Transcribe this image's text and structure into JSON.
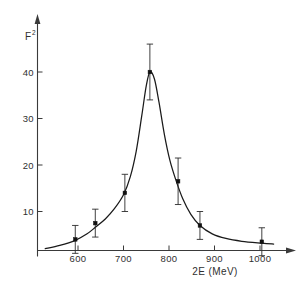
{
  "chart_data": {
    "type": "scatter",
    "title": "",
    "subtitle": "",
    "xlabel": "2E  (MeV)",
    "ylabel": "F",
    "ylabel_superscript": "2",
    "ylabel_full": "F2",
    "xlim": [
      520,
      1045
    ],
    "ylim": [
      0,
      48
    ],
    "xticks": [
      600,
      700,
      800,
      900,
      1000
    ],
    "xtick_labels": [
      "600",
      "700",
      "800",
      "900",
      "1000"
    ],
    "yticks": [
      10,
      20,
      30,
      40
    ],
    "ytick_labels": [
      "10",
      "20",
      "30",
      "40"
    ],
    "grid": false,
    "legend": null,
    "legend_position": "none",
    "x": [
      594,
      638,
      703,
      758,
      820,
      868,
      1004
    ],
    "values": [
      4.0,
      7.5,
      14.0,
      40.0,
      16.5,
      7.0,
      3.5
    ],
    "yerr": [
      3.0,
      3.0,
      4.0,
      6.0,
      5.0,
      3.0,
      3.0
    ],
    "series": [
      {
        "name": "measured F2",
        "marker": "square-dot",
        "points": [
          {
            "x": 594,
            "y": 4.0,
            "yerr": 3.0
          },
          {
            "x": 638,
            "y": 7.5,
            "yerr": 3.0
          },
          {
            "x": 703,
            "y": 14.0,
            "yerr": 4.0
          },
          {
            "x": 758,
            "y": 40.0,
            "yerr": 6.0
          },
          {
            "x": 820,
            "y": 16.5,
            "yerr": 5.0
          },
          {
            "x": 868,
            "y": 7.0,
            "yerr": 3.0
          },
          {
            "x": 1004,
            "y": 3.5,
            "yerr": 3.0
          }
        ]
      },
      {
        "name": "fitted resonance curve",
        "marker": "none",
        "curve": [
          {
            "x": 528,
            "y": 2.0
          },
          {
            "x": 560,
            "y": 2.7
          },
          {
            "x": 594,
            "y": 3.8
          },
          {
            "x": 620,
            "y": 5.2
          },
          {
            "x": 638,
            "y": 6.6
          },
          {
            "x": 660,
            "y": 8.4
          },
          {
            "x": 680,
            "y": 10.6
          },
          {
            "x": 700,
            "y": 13.6
          },
          {
            "x": 715,
            "y": 17.5
          },
          {
            "x": 728,
            "y": 23.0
          },
          {
            "x": 740,
            "y": 30.5
          },
          {
            "x": 750,
            "y": 37.0
          },
          {
            "x": 758,
            "y": 40.0
          },
          {
            "x": 768,
            "y": 38.5
          },
          {
            "x": 778,
            "y": 33.5
          },
          {
            "x": 790,
            "y": 26.5
          },
          {
            "x": 802,
            "y": 21.0
          },
          {
            "x": 815,
            "y": 16.8
          },
          {
            "x": 830,
            "y": 12.8
          },
          {
            "x": 848,
            "y": 9.4
          },
          {
            "x": 868,
            "y": 7.0
          },
          {
            "x": 895,
            "y": 5.2
          },
          {
            "x": 925,
            "y": 4.2
          },
          {
            "x": 960,
            "y": 3.6
          },
          {
            "x": 1004,
            "y": 3.2
          },
          {
            "x": 1030,
            "y": 3.0
          }
        ]
      }
    ]
  },
  "axes": {
    "x_axis_name": "2E axis",
    "y_axis_name": "F squared axis",
    "x_arrow": true,
    "y_arrow": true
  }
}
